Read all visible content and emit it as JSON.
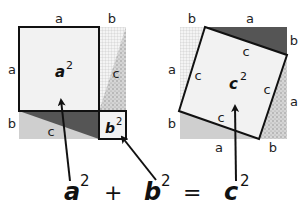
{
  "diagram": {
    "left_figure": {
      "side_labels": {
        "top_a": "a",
        "top_b": "b",
        "left_a": "a",
        "left_b": "b"
      },
      "hyp_labels": [
        "c",
        "c"
      ],
      "square_a_label": "a",
      "square_b_label": "b",
      "exponent": "2"
    },
    "right_figure": {
      "side_labels": {
        "top_b": "b",
        "top_a": "a",
        "right_b": "b",
        "right_a": "a",
        "left_a": "a",
        "left_b": "b",
        "bottom_a": "a",
        "bottom_b": "b"
      },
      "hyp_labels": [
        "c",
        "c",
        "c",
        "c"
      ],
      "square_c_label": "c",
      "exponent": "2"
    },
    "equation": {
      "a": "a",
      "plus": "+",
      "b": "b",
      "equals": "=",
      "c": "c",
      "exponent": "2"
    },
    "colors": {
      "light_fill": "#f2f2f2",
      "dark_triangle": "#555555",
      "light_triangle": "#cfcfcf",
      "grid_triangle": "#e6e6e6",
      "speckle_triangle": "#bdbdbd",
      "outline": "#111111"
    }
  }
}
